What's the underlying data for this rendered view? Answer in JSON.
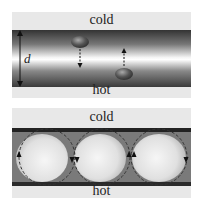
{
  "top_panel": {
    "top_label": "cold",
    "bottom_label": "hot",
    "dimension_label": "d",
    "description": "Fluid layer with temperature gradient; blobs displaced up/down"
  },
  "bottom_panel": {
    "top_label": "cold",
    "bottom_label": "hot",
    "description": "Convection rolls (three circulation cells)"
  },
  "colors": {
    "panel_bg": "#e8e8e8",
    "band_dark": "#3a3a3a",
    "band_light": "#ffffff",
    "arrow": "#222222"
  }
}
